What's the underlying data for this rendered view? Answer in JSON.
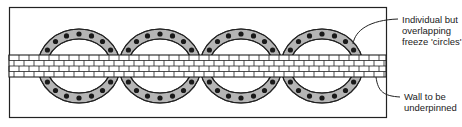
{
  "diagram": {
    "type": "plan view",
    "labels": {
      "circles": [
        "Individual but",
        "overlapping",
        "freeze 'circles'"
      ],
      "wall": [
        "Wall to be",
        "underpinned"
      ]
    },
    "rings": [
      {
        "cx": 79,
        "cy": 66
      },
      {
        "cx": 160,
        "cy": 66
      },
      {
        "cx": 241,
        "cy": 66
      },
      {
        "cx": 322,
        "cy": 66
      }
    ],
    "colors": {
      "ring_fill": "#b5b5b5",
      "outline": "#222222",
      "freeze_pipe": "#1a1a1a",
      "brick": "#ffffff"
    }
  }
}
